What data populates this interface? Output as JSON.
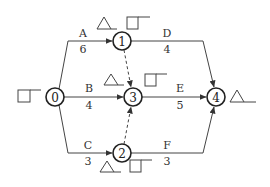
{
  "diagram": {
    "type": "network-schedule (arrow diagram)",
    "nodes": [
      {
        "id": "0",
        "label": "0"
      },
      {
        "id": "1",
        "label": "1"
      },
      {
        "id": "2",
        "label": "2"
      },
      {
        "id": "3",
        "label": "3"
      },
      {
        "id": "4",
        "label": "4"
      }
    ],
    "activities": [
      {
        "name": "A",
        "duration": "6",
        "from": "0",
        "to": "1"
      },
      {
        "name": "B",
        "duration": "4",
        "from": "0",
        "to": "3"
      },
      {
        "name": "C",
        "duration": "3",
        "from": "0",
        "to": "2"
      },
      {
        "name": "D",
        "duration": "4",
        "from": "1",
        "to": "4"
      },
      {
        "name": "E",
        "duration": "5",
        "from": "3",
        "to": "4"
      },
      {
        "name": "F",
        "duration": "3",
        "from": "2",
        "to": "4"
      }
    ],
    "dummy_activities": [
      {
        "from": "1",
        "to": "3",
        "style": "dashed"
      },
      {
        "from": "2",
        "to": "3",
        "style": "dashed"
      }
    ],
    "blank_markers": {
      "node0": [
        "square"
      ],
      "node1": [
        "triangle",
        "square"
      ],
      "node2": [
        "triangle",
        "square"
      ],
      "node3": [
        "triangle",
        "square"
      ],
      "node4": [
        "triangle"
      ]
    }
  }
}
